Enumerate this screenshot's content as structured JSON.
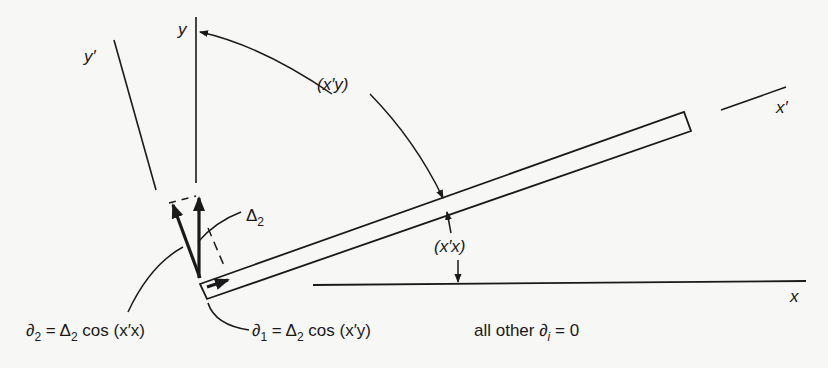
{
  "diagram": {
    "type": "rotated beam element with coordinate axes",
    "colors": {
      "ink": "#1a1a1a",
      "paper": "#f7f7f5"
    },
    "axes": {
      "x": "x",
      "y": "y",
      "x_prime": "x′",
      "y_prime": "y′"
    },
    "angle_labels": {
      "x_prime_y": "(x′y)",
      "x_prime_x": "(x′x)"
    },
    "displacement_label": {
      "symbol": "Δ",
      "subscript": "2"
    },
    "equations": [
      {
        "lhs": "∂",
        "lhs_sub": "2",
        "rhs_a": " = Δ",
        "rhs_sub": "2",
        "rhs_b": " cos (x′x)"
      },
      {
        "lhs": "∂",
        "lhs_sub": "1",
        "rhs_a": " = Δ",
        "rhs_sub": "2",
        "rhs_b": " cos (x′y)"
      }
    ],
    "note": {
      "text": "all other ∂",
      "sub": "i",
      "tail": " = 0"
    }
  }
}
